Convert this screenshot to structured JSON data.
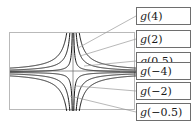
{
  "figure": {
    "background_color": "#ffffff",
    "frame_color": "#b9b9b9",
    "curve_color": "#1a1a1a",
    "leader_color": "#9a9a9a",
    "legend_border_color": "#6e6e6e"
  },
  "legend": {
    "items": [
      {
        "label": "g(4)",
        "fn": "g",
        "arg": "(4)"
      },
      {
        "label": "g(2)",
        "fn": "g",
        "arg": "(2)"
      },
      {
        "label": "g(0.5)",
        "fn": "g",
        "arg": "(0.5)"
      },
      {
        "label": "g(−4)",
        "fn": "g",
        "arg": "(−4)"
      },
      {
        "label": "g(−2)",
        "fn": "g",
        "arg": "(−2)"
      },
      {
        "label": "g(−0.5)",
        "fn": "g",
        "arg": "(−0.5)"
      }
    ]
  },
  "chart_data": {
    "type": "line",
    "title": "",
    "xlabel": "",
    "ylabel": "",
    "grid": false,
    "axes_shown": true,
    "legend_position": "right-callout-boxes",
    "xlim": [
      -8,
      8
    ],
    "ylim": [
      -5,
      5
    ],
    "series": [
      {
        "name": "g(4)",
        "parameter": 4,
        "formula": "y = 4/x",
        "branches": [
          "x>0 upper",
          "x<0 lower"
        ]
      },
      {
        "name": "g(2)",
        "parameter": 2,
        "formula": "y = 2/x",
        "branches": [
          "x>0 upper",
          "x<0 lower"
        ]
      },
      {
        "name": "g(0.5)",
        "parameter": 0.5,
        "formula": "y = 0.5/x",
        "branches": [
          "x>0 upper",
          "x<0 lower"
        ]
      },
      {
        "name": "g(-4)",
        "parameter": -4,
        "formula": "y = -4/x",
        "branches": [
          "x>0 lower",
          "x<0 upper"
        ]
      },
      {
        "name": "g(-2)",
        "parameter": -2,
        "formula": "y = -2/x",
        "branches": [
          "x>0 lower",
          "x<0 upper"
        ]
      },
      {
        "name": "g(-0.5)",
        "parameter": -0.5,
        "formula": "y = -0.5/x",
        "branches": [
          "x>0 lower",
          "x<0 upper"
        ]
      }
    ]
  }
}
